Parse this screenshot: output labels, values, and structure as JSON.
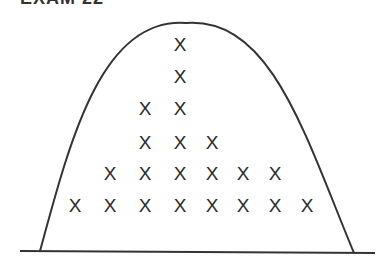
{
  "title_fragment": "EXAM 22",
  "diagram": {
    "mark_glyph": "X",
    "curve_color": "#333333",
    "mark_color": "#2a2a2a",
    "baseline": {
      "x1": 20,
      "y1": 251,
      "x2": 375,
      "y2": 253
    },
    "curve": {
      "left_foot": [
        40,
        251
      ],
      "peak": [
        186,
        23
      ],
      "right_foot": [
        354,
        253
      ]
    },
    "columns_x": [
      75,
      110,
      145,
      180,
      212,
      243,
      275,
      307
    ],
    "rows_y": [
      205,
      173,
      142,
      108,
      76,
      44
    ],
    "column_counts": [
      1,
      2,
      4,
      6,
      3,
      2,
      2,
      1
    ]
  },
  "chart_data": {
    "type": "scatter",
    "title": "",
    "xlabel": "",
    "ylabel": "",
    "categories": [
      1,
      2,
      3,
      4,
      5,
      6,
      7,
      8
    ],
    "values": [
      1,
      2,
      4,
      6,
      3,
      2,
      2,
      1
    ]
  }
}
